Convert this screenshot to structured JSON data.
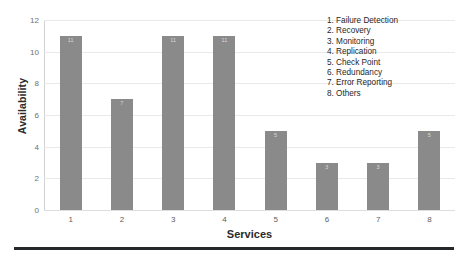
{
  "chart_data": {
    "type": "bar",
    "title": "",
    "xlabel": "Services",
    "ylabel": "Availability",
    "categories": [
      "1",
      "2",
      "3",
      "4",
      "5",
      "6",
      "7",
      "8"
    ],
    "values": [
      11,
      7,
      11,
      11,
      5,
      3,
      3,
      5
    ],
    "ylim": [
      0,
      12
    ],
    "yticks": [
      0,
      2,
      4,
      6,
      8,
      10,
      12
    ],
    "grid": true,
    "legend_position": "top-right",
    "bar_color": "#8a8a8a",
    "data_labels_shown": true,
    "series": [
      {
        "name": "Availability",
        "values": [
          11,
          7,
          11,
          11,
          5,
          3,
          3,
          5
        ]
      }
    ],
    "legend": [
      "1. Failure Detection",
      "2. Recovery",
      "3. Monitoring",
      "4. Replication",
      "5. Check Point",
      "6. Redundancy",
      "7. Error Reporting",
      "8. Others"
    ]
  }
}
